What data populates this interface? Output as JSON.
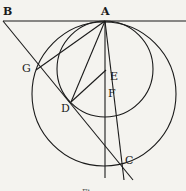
{
  "diagram": {
    "type": "geometric-figure",
    "stroke_color": "#1a1a1a",
    "background": "#f4f3ef",
    "points": {
      "A": {
        "label": "A",
        "x": 105,
        "y": 21
      },
      "B": {
        "label": "B",
        "x": 3,
        "y": 21
      },
      "G": {
        "label": "G",
        "x": 39,
        "y": 66
      },
      "D": {
        "label": "D",
        "x": 71,
        "y": 102
      },
      "E": {
        "label": "E",
        "x": 105,
        "y": 70
      },
      "F": {
        "label": "F",
        "x": 111,
        "y": 92
      },
      "C": {
        "label": "C",
        "x": 122,
        "y": 164
      }
    },
    "labels": {
      "A": "A",
      "B": "B",
      "G": "G",
      "D": "D",
      "E": "E",
      "F": "F",
      "C": "C"
    },
    "caption": "Fi"
  }
}
